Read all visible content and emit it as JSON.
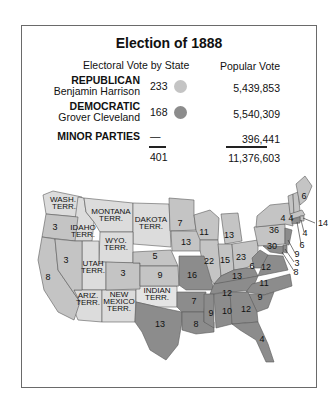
{
  "title": "Election of 1888",
  "headers": {
    "electoral": "Electoral Vote by State",
    "popular": "Popular Vote"
  },
  "colors": {
    "republican": "#c4c4c4",
    "democratic": "#8c8c8c",
    "territory": "#dcdcdc",
    "border": "#555555"
  },
  "parties": [
    {
      "party": "REPUBLICAN",
      "candidate": "Benjamin Harrison",
      "electoral": "233",
      "popular": "5,439,853",
      "color": "#c4c4c4"
    },
    {
      "party": "DEMOCRATIC",
      "candidate": "Grover Cleveland",
      "electoral": "168",
      "popular": "5,540,309",
      "color": "#8c8c8c"
    },
    {
      "party": "MINOR PARTIES",
      "candidate": "",
      "electoral": "—",
      "popular": "396,441",
      "color": ""
    }
  ],
  "totals": {
    "electoral": "401",
    "popular": "11,376,603"
  },
  "map": {
    "territories": [
      {
        "name": "WASH. TERR.",
        "line1": "WASH.",
        "line2": "TERR."
      },
      {
        "name": "IDAHO TERR.",
        "line1": "IDAHO",
        "line2": "TERR."
      },
      {
        "name": "MONTANA TERR.",
        "line1": "MONTANA",
        "line2": "TERR."
      },
      {
        "name": "DAKOTA TERR.",
        "line1": "DAKOTA",
        "line2": "TERR."
      },
      {
        "name": "WYO. TERR.",
        "line1": "WYO.",
        "line2": "TERR."
      },
      {
        "name": "UTAH TERR.",
        "line1": "UTAH",
        "line2": "TERR."
      },
      {
        "name": "ARIZ. TERR.",
        "line1": "ARIZ.",
        "line2": "TERR."
      },
      {
        "name": "NEW MEXICO TERR.",
        "line1": "NEW",
        "line2": "MEXICO",
        "line3": "TERR."
      },
      {
        "name": "INDIAN TERR.",
        "line1": "INDIAN",
        "line2": "TERR."
      }
    ],
    "states": [
      {
        "state": "Oregon",
        "votes": "3",
        "winner": "R"
      },
      {
        "state": "California",
        "votes": "8",
        "winner": "R"
      },
      {
        "state": "Nevada",
        "votes": "3",
        "winner": "R"
      },
      {
        "state": "Colorado",
        "votes": "3",
        "winner": "R"
      },
      {
        "state": "Nebraska",
        "votes": "5",
        "winner": "R"
      },
      {
        "state": "Kansas",
        "votes": "9",
        "winner": "R"
      },
      {
        "state": "Minnesota",
        "votes": "7",
        "winner": "R"
      },
      {
        "state": "Iowa",
        "votes": "13",
        "winner": "R"
      },
      {
        "state": "Wisconsin",
        "votes": "11",
        "winner": "R"
      },
      {
        "state": "Michigan",
        "votes": "13",
        "winner": "R"
      },
      {
        "state": "Illinois",
        "votes": "22",
        "winner": "R"
      },
      {
        "state": "Indiana",
        "votes": "15",
        "winner": "R"
      },
      {
        "state": "Ohio",
        "votes": "23",
        "winner": "R"
      },
      {
        "state": "Pennsylvania",
        "votes": "30",
        "winner": "R"
      },
      {
        "state": "New York",
        "votes": "36",
        "winner": "R"
      },
      {
        "state": "Vermont",
        "votes": "4",
        "winner": "R"
      },
      {
        "state": "New Hampshire",
        "votes": "4",
        "winner": "R"
      },
      {
        "state": "Maine",
        "votes": "6",
        "winner": "R"
      },
      {
        "state": "Massachusetts",
        "votes": "14",
        "winner": "R"
      },
      {
        "state": "Rhode Island",
        "votes": "4",
        "winner": "R"
      },
      {
        "state": "Connecticut",
        "votes": "6",
        "winner": "D"
      },
      {
        "state": "New Jersey",
        "votes": "9",
        "winner": "D"
      },
      {
        "state": "Delaware",
        "votes": "3",
        "winner": "D"
      },
      {
        "state": "Maryland",
        "votes": "8",
        "winner": "D"
      },
      {
        "state": "West Virginia",
        "votes": "6",
        "winner": "D"
      },
      {
        "state": "Virginia",
        "votes": "12",
        "winner": "D"
      },
      {
        "state": "Kentucky",
        "votes": "13",
        "winner": "D"
      },
      {
        "state": "Missouri",
        "votes": "16",
        "winner": "D"
      },
      {
        "state": "Tennessee",
        "votes": "12",
        "winner": "D"
      },
      {
        "state": "North Carolina",
        "votes": "11",
        "winner": "D"
      },
      {
        "state": "South Carolina",
        "votes": "9",
        "winner": "D"
      },
      {
        "state": "Arkansas",
        "votes": "7",
        "winner": "D"
      },
      {
        "state": "Texas",
        "votes": "13",
        "winner": "D"
      },
      {
        "state": "Louisiana",
        "votes": "8",
        "winner": "D"
      },
      {
        "state": "Mississippi",
        "votes": "9",
        "winner": "D"
      },
      {
        "state": "Alabama",
        "votes": "10",
        "winner": "D"
      },
      {
        "state": "Georgia",
        "votes": "12",
        "winner": "D"
      },
      {
        "state": "Florida",
        "votes": "4",
        "winner": "D"
      }
    ]
  }
}
